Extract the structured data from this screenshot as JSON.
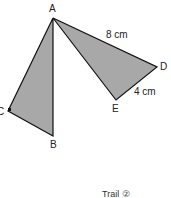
{
  "diagram": {
    "fill_color": "#a8a8a8",
    "stroke_color": "#111111",
    "triangles": [
      {
        "name": "ABC",
        "points": "53,18 53,136 8,111"
      },
      {
        "name": "ADE",
        "points": "53,18 157,67 116,100"
      }
    ],
    "vertices": {
      "A": "A",
      "B": "B",
      "C": "C",
      "D": "D",
      "E": "E"
    },
    "measurements": {
      "AD": "8 cm",
      "DE": "4 cm"
    },
    "right_angle_at": "C"
  },
  "caption": "Trail ②"
}
